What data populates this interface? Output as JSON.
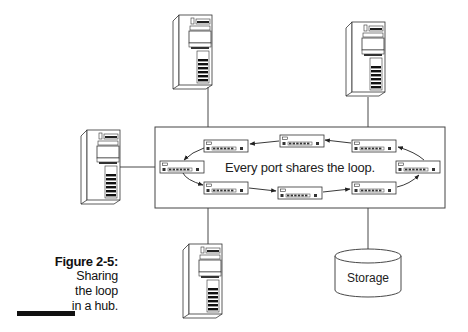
{
  "figure": {
    "number": "Figure 2-5:",
    "caption_lines": [
      "Sharing",
      "the loop",
      "in a hub."
    ]
  },
  "hub": {
    "label": "Every port shares the loop.",
    "port_devices": [
      {
        "position": "left"
      },
      {
        "position": "top-left"
      },
      {
        "position": "top-center"
      },
      {
        "position": "top-right"
      },
      {
        "position": "right"
      },
      {
        "position": "bottom-right"
      },
      {
        "position": "bottom-center"
      },
      {
        "position": "bottom-left"
      }
    ],
    "loop_direction": "counter-clockwise on top, clockwise on bottom: left → bottom-left → bottom-center → bottom-right → right → top-right → top-center → top-left → left"
  },
  "nodes": {
    "servers": [
      {
        "position": "top-left",
        "icon": "tower-server-icon"
      },
      {
        "position": "top-right",
        "icon": "tower-server-icon"
      },
      {
        "position": "left",
        "icon": "tower-server-icon"
      },
      {
        "position": "bottom",
        "icon": "tower-server-icon"
      }
    ],
    "storage": {
      "label": "Storage",
      "icon": "storage-cylinder-icon"
    }
  },
  "colors": {
    "line": "#222222",
    "background": "#ffffff",
    "caption_bar": "#111111"
  }
}
